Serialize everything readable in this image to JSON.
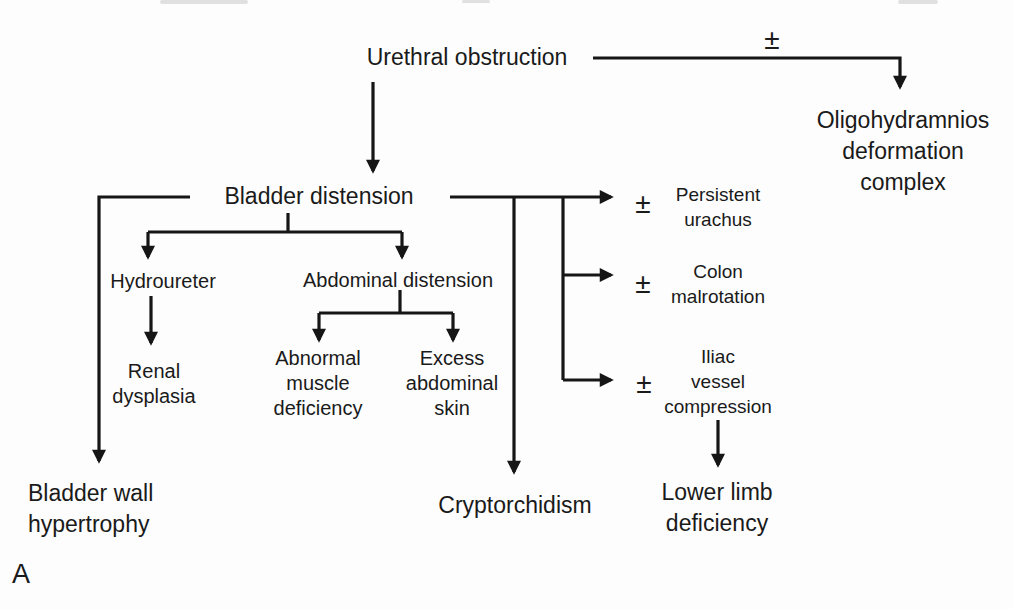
{
  "figure_label": "A",
  "colors": {
    "ink": "#1a1a1a",
    "background": "#fdfdfd"
  },
  "qualifiers": {
    "oligohydramnios": "±",
    "persistent_urachus": "±",
    "colon_malrotation": "±",
    "iliac_vessel_compression": "±"
  },
  "nodes": {
    "urethral_obstruction": {
      "lines": [
        "Urethral obstruction"
      ]
    },
    "oligohydramnios_complex": {
      "lines": [
        "Oligohydramnios",
        "deformation",
        "complex"
      ]
    },
    "bladder_distension": {
      "lines": [
        "Bladder distension"
      ]
    },
    "hydroureter": {
      "lines": [
        "Hydroureter"
      ]
    },
    "abdominal_distension": {
      "lines": [
        "Abdominal distension"
      ]
    },
    "renal_dysplasia": {
      "lines": [
        "Renal",
        "dysplasia"
      ]
    },
    "abnormal_muscle_deficiency": {
      "lines": [
        "Abnormal",
        "muscle",
        "deficiency"
      ]
    },
    "excess_abdominal_skin": {
      "lines": [
        "Excess",
        "abdominal",
        "skin"
      ]
    },
    "bladder_wall_hypertrophy": {
      "lines": [
        "Bladder wall",
        "hypertrophy"
      ]
    },
    "cryptorchidism": {
      "lines": [
        "Cryptorchidism"
      ]
    },
    "persistent_urachus": {
      "lines": [
        "Persistent",
        "urachus"
      ]
    },
    "colon_malrotation": {
      "lines": [
        "Colon",
        "malrotation"
      ]
    },
    "iliac_vessel_compression": {
      "lines": [
        "Iliac",
        "vessel",
        "compression"
      ]
    },
    "lower_limb_deficiency": {
      "lines": [
        "Lower limb",
        "deficiency"
      ]
    }
  }
}
